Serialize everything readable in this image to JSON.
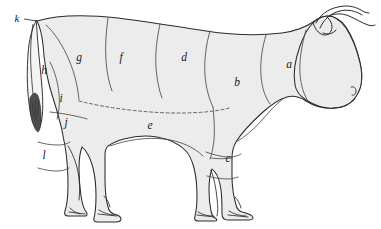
{
  "figure": {
    "style": "engraving",
    "colors": {
      "background": "#ffffff",
      "body_fill": "#ececec",
      "outline": "#2b2b2b",
      "cut_line": "#4a4a4a",
      "label_text": "#1a1a1a",
      "tail_tuft": "#555555"
    }
  },
  "labels": [
    {
      "id": "a",
      "text": "a",
      "x": 289,
      "y": 68
    },
    {
      "id": "b",
      "text": "b",
      "x": 237,
      "y": 86
    },
    {
      "id": "c",
      "text": "c",
      "x": 228,
      "y": 162
    },
    {
      "id": "d",
      "text": "d",
      "x": 184,
      "y": 61
    },
    {
      "id": "e",
      "text": "e",
      "x": 150,
      "y": 129
    },
    {
      "id": "f",
      "text": "f",
      "x": 121,
      "y": 61
    },
    {
      "id": "g",
      "text": "g",
      "x": 79,
      "y": 61
    },
    {
      "id": "h",
      "text": "h",
      "x": 44,
      "y": 74
    },
    {
      "id": "i",
      "text": "i",
      "x": 61,
      "y": 102
    },
    {
      "id": "j",
      "text": "j",
      "x": 66,
      "y": 126
    },
    {
      "id": "k",
      "text": "k",
      "x": 17,
      "y": 22
    },
    {
      "id": "l",
      "text": "l",
      "x": 44,
      "y": 159
    }
  ],
  "leader_lines": [
    {
      "for": "k",
      "from_x": 24,
      "from_y": 19,
      "to_x": 37,
      "to_y": 21
    }
  ]
}
